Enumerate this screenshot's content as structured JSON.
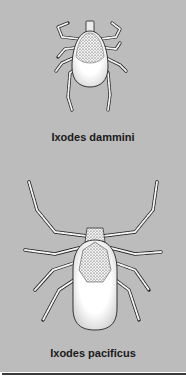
{
  "figure": {
    "background_color": "#bcbcbc",
    "rule_color": "#3a3a3a",
    "specimens": [
      {
        "label": "Ixodes dammini"
      },
      {
        "label": "Ixodes pacificus"
      }
    ]
  }
}
